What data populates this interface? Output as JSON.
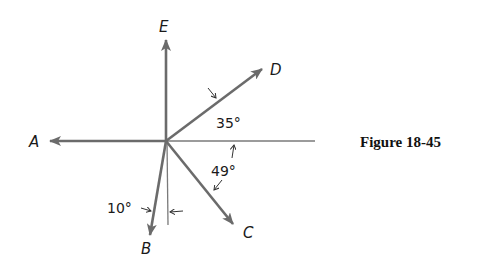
{
  "figure": {
    "caption": "Figure 18-45",
    "vectors": [
      {
        "label": "A",
        "direction": "west"
      },
      {
        "label": "B",
        "direction": "10° west of south"
      },
      {
        "label": "C",
        "direction": "49° south of east"
      },
      {
        "label": "D",
        "direction": "35° north of east"
      },
      {
        "label": "E",
        "direction": "north"
      }
    ],
    "angles": [
      {
        "label": "35°",
        "between": "D and positive x-axis"
      },
      {
        "label": "49°",
        "between": "C and positive x-axis"
      },
      {
        "label": "10°",
        "between": "B and negative y-axis"
      }
    ],
    "colors": {
      "vector": "#6b6b6b",
      "axis": "#7a7a7a",
      "text": "#1a1a1a"
    }
  }
}
